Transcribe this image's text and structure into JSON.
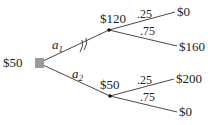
{
  "diagram": {
    "type": "decision-tree",
    "root": {
      "label": "$50",
      "node_type": "decision",
      "color": "#9a9a9a"
    },
    "actions": [
      {
        "label": "a",
        "subscript": "1",
        "pruned": true,
        "chance_node": {
          "label": "$120",
          "outcomes": [
            {
              "probability": ".25",
              "value": "$0"
            },
            {
              "probability": ".75",
              "value": "$160"
            }
          ]
        }
      },
      {
        "label": "a",
        "subscript": "2",
        "pruned": false,
        "chance_node": {
          "label": "$50",
          "outcomes": [
            {
              "probability": ".25",
              "value": "$200"
            },
            {
              "probability": ".75",
              "value": "$0"
            }
          ]
        }
      }
    ]
  }
}
